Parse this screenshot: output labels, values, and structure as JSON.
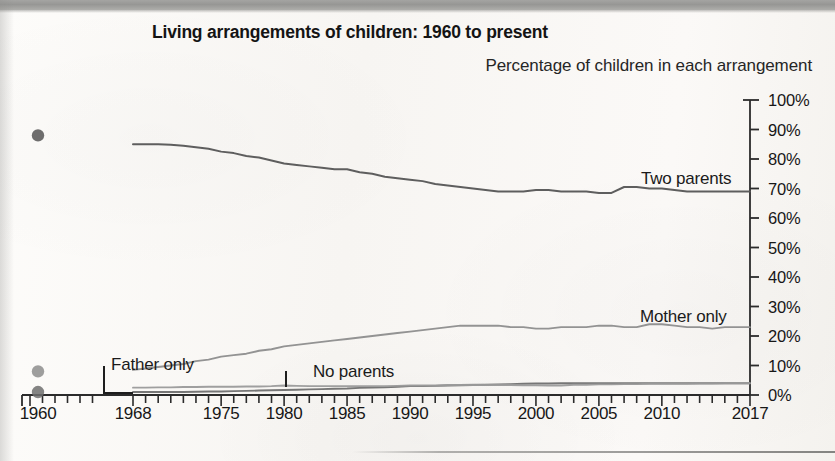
{
  "figure": {
    "title": "Living arrangements of children: 1960 to present",
    "subtitle": "Percentage of children in each arrangement"
  },
  "chart_data": {
    "type": "line",
    "title": "Living arrangements of children: 1960 to present",
    "subtitle": "Percentage of children in each arrangement",
    "xlabel": "",
    "ylabel": "Percentage of children in each arrangement",
    "ylim": [
      0,
      100
    ],
    "ytick_labels": [
      "0%",
      "10%",
      "20%",
      "30%",
      "40%",
      "50%",
      "60%",
      "70%",
      "80%",
      "90%",
      "100%"
    ],
    "ytick_values": [
      0,
      10,
      20,
      30,
      40,
      50,
      60,
      70,
      80,
      90,
      100
    ],
    "yaxis_position": "right",
    "xtick_labels": [
      "1960",
      "1968",
      "1975",
      "1980",
      "1985",
      "1990",
      "1995",
      "2000",
      "2005",
      "2010",
      "2017"
    ],
    "xtick_values": [
      1960,
      1968,
      1975,
      1980,
      1985,
      1990,
      1995,
      2000,
      2005,
      2010,
      2017
    ],
    "xlim": [
      1968,
      2017
    ],
    "axis_break_note": "1960 plotted as isolated points left of a break in the x-axis; continuous lines run 1968-2017",
    "grid": false,
    "legend_position": "inline-annotations",
    "annotations": [
      {
        "label": "Two parents",
        "x": 641,
        "y": 169
      },
      {
        "label": "Mother only",
        "x": 640,
        "y": 307
      },
      {
        "label": "Father only",
        "x": 111,
        "y": 355
      },
      {
        "label": "No parents",
        "x": 313,
        "y": 362
      }
    ],
    "points_1960": [
      {
        "series": "Two parents",
        "x": 1960,
        "y": 88
      },
      {
        "series": "Mother only",
        "x": 1960,
        "y": 8
      },
      {
        "series": "Father only",
        "x": 1960,
        "y": 1
      }
    ],
    "series": [
      {
        "name": "Two parents",
        "color": "#555555",
        "x": [
          1968,
          1969,
          1970,
          1971,
          1972,
          1973,
          1974,
          1975,
          1976,
          1977,
          1978,
          1979,
          1980,
          1981,
          1982,
          1983,
          1984,
          1985,
          1986,
          1987,
          1988,
          1989,
          1990,
          1991,
          1992,
          1993,
          1994,
          1995,
          1996,
          1997,
          1998,
          1999,
          2000,
          2001,
          2002,
          2003,
          2004,
          2005,
          2006,
          2007,
          2008,
          2009,
          2010,
          2011,
          2012,
          2013,
          2014,
          2015,
          2016,
          2017
        ],
        "values": [
          85,
          85,
          85,
          84.8,
          84.5,
          84,
          83.5,
          82.5,
          82,
          81,
          80.5,
          79.5,
          78.5,
          78,
          77.5,
          77,
          76.5,
          76.5,
          75.5,
          75,
          74,
          73.5,
          73,
          72.5,
          71.5,
          71,
          70.5,
          70,
          69.5,
          69,
          69,
          69,
          69.5,
          69.5,
          69,
          69,
          69,
          68.5,
          68.5,
          70.5,
          70.5,
          70,
          70,
          69.5,
          69,
          69,
          69,
          69,
          69,
          69
        ]
      },
      {
        "name": "Mother only",
        "color": "#8d8d8d",
        "x": [
          1968,
          1969,
          1970,
          1971,
          1972,
          1973,
          1974,
          1975,
          1976,
          1977,
          1978,
          1979,
          1980,
          1981,
          1982,
          1983,
          1984,
          1985,
          1986,
          1987,
          1988,
          1989,
          1990,
          1991,
          1992,
          1993,
          1994,
          1995,
          1996,
          1997,
          1998,
          1999,
          2000,
          2001,
          2002,
          2003,
          2004,
          2005,
          2006,
          2007,
          2008,
          2009,
          2010,
          2011,
          2012,
          2013,
          2014,
          2015,
          2016,
          2017
        ],
        "values": [
          8.5,
          9,
          9.5,
          10,
          10.5,
          11.5,
          12,
          13,
          13.5,
          14,
          15,
          15.5,
          16.5,
          17,
          17.5,
          18,
          18.5,
          19,
          19.5,
          20,
          20.5,
          21,
          21.5,
          22,
          22.5,
          23,
          23.5,
          23.5,
          23.5,
          23.5,
          23,
          23,
          22.5,
          22.5,
          23,
          23,
          23,
          23.5,
          23.5,
          23,
          23,
          24,
          24,
          23.5,
          23,
          23,
          22.5,
          23,
          23,
          23
        ]
      },
      {
        "name": "Father only",
        "color": "#6f6f6f",
        "x": [
          1968,
          1969,
          1970,
          1971,
          1972,
          1973,
          1974,
          1975,
          1976,
          1977,
          1978,
          1979,
          1980,
          1981,
          1982,
          1983,
          1984,
          1985,
          1986,
          1987,
          1988,
          1989,
          1990,
          1991,
          1992,
          1993,
          1994,
          1995,
          1996,
          1997,
          1998,
          1999,
          2000,
          2001,
          2002,
          2003,
          2004,
          2005,
          2006,
          2007,
          2008,
          2009,
          2010,
          2011,
          2012,
          2013,
          2014,
          2015,
          2016,
          2017
        ],
        "values": [
          1,
          1,
          1,
          1,
          1,
          1.1,
          1.2,
          1.2,
          1.3,
          1.4,
          1.5,
          1.6,
          1.7,
          1.8,
          1.9,
          2,
          2.1,
          2.2,
          2.4,
          2.5,
          2.6,
          2.8,
          3,
          3,
          3.1,
          3.2,
          3.3,
          3.4,
          3.5,
          3.6,
          3.7,
          3.8,
          3.9,
          3.9,
          4,
          4,
          4,
          4,
          4,
          4,
          4,
          4,
          4,
          4,
          4,
          4,
          4,
          4,
          4,
          4
        ]
      },
      {
        "name": "No parents",
        "color": "#9a9a9a",
        "x": [
          1968,
          1969,
          1970,
          1971,
          1972,
          1973,
          1974,
          1975,
          1976,
          1977,
          1978,
          1979,
          1980,
          1981,
          1982,
          1983,
          1984,
          1985,
          1986,
          1987,
          1988,
          1989,
          1990,
          1991,
          1992,
          1993,
          1994,
          1995,
          1996,
          1997,
          1998,
          1999,
          2000,
          2001,
          2002,
          2003,
          2004,
          2005,
          2006,
          2007,
          2008,
          2009,
          2010,
          2011,
          2012,
          2013,
          2014,
          2015,
          2016,
          2017
        ],
        "values": [
          2.5,
          2.5,
          2.6,
          2.6,
          2.7,
          2.7,
          2.8,
          2.8,
          2.8,
          2.9,
          2.9,
          3,
          3.2,
          3.1,
          3,
          3,
          3,
          3,
          3,
          3,
          3,
          3.1,
          3.2,
          3.2,
          3.2,
          3.4,
          3.4,
          3.5,
          3.4,
          3.4,
          3.4,
          3.3,
          3.3,
          3.2,
          3.2,
          3.5,
          3.5,
          3.6,
          3.6,
          3.7,
          3.7,
          3.8,
          3.8,
          3.8,
          3.8,
          3.9,
          3.9,
          4,
          4,
          4
        ]
      }
    ]
  },
  "colors": {
    "axis": "#2b2b2b",
    "two_parents": "#555555",
    "mother_only": "#8d8d8d",
    "father_only": "#6f6f6f",
    "no_parents": "#9a9a9a",
    "header_bar": "#9d9d9b",
    "paper": "#fbfaf8"
  }
}
